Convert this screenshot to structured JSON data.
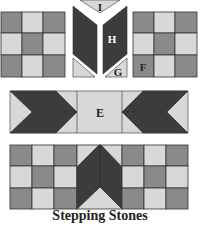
{
  "title": "Stepping Stones",
  "labels": {
    "E": "E",
    "F": "F",
    "G": "G",
    "H": "H",
    "I": "I"
  },
  "colors": {
    "dark": "#3c3c3c",
    "medium": "#8a8a8a",
    "light": "#d8d8d8",
    "line": "#333333"
  },
  "pieces": [
    {
      "id": "left-nine-patch",
      "type": "nine-patch"
    },
    {
      "id": "center-chevron-unit",
      "labels": [
        "I",
        "H",
        "G"
      ]
    },
    {
      "id": "right-nine-patch",
      "type": "nine-patch",
      "label": "F"
    },
    {
      "id": "middle-flying-geese-strip",
      "label": "E"
    },
    {
      "id": "bottom-assembled-row"
    }
  ]
}
